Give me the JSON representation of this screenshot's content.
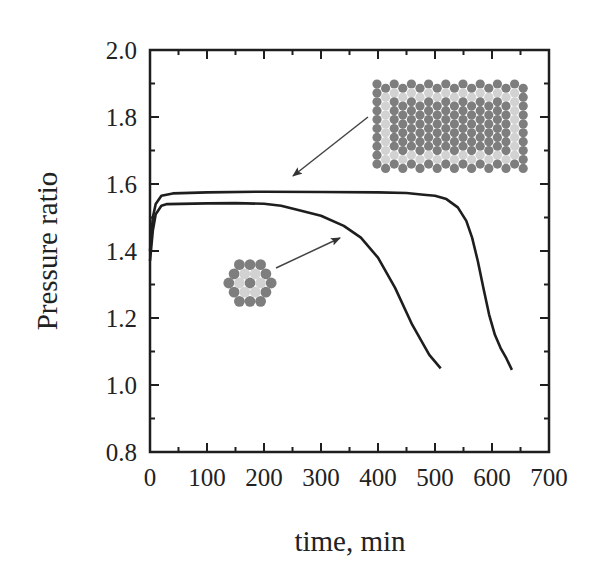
{
  "chart_data": {
    "type": "line",
    "title": "",
    "xlabel": "time, min",
    "ylabel": "Pressure ratio",
    "xlim": [
      0,
      700
    ],
    "ylim": [
      0.8,
      2.0
    ],
    "x_ticks": [
      0,
      100,
      200,
      300,
      400,
      500,
      600,
      700
    ],
    "x_tick_labels": [
      "0",
      "100",
      "200",
      "300",
      "400",
      "500",
      "600",
      "700"
    ],
    "y_ticks": [
      0.8,
      1.0,
      1.2,
      1.4,
      1.6,
      1.8,
      2.0
    ],
    "y_tick_labels": [
      "0.8",
      "1.0",
      "1.2",
      "1.4",
      "1.6",
      "1.8",
      "2.0"
    ],
    "grid": false,
    "legend": null,
    "series": [
      {
        "name": "large rectangular fiber bundle (inset, top right)",
        "x": [
          0,
          5,
          10,
          20,
          40,
          100,
          200,
          300,
          400,
          450,
          480,
          500,
          520,
          540,
          555,
          565,
          575,
          585,
          595,
          605,
          615,
          625,
          635
        ],
        "y": [
          1.4,
          1.5,
          1.54,
          1.565,
          1.572,
          1.575,
          1.577,
          1.576,
          1.575,
          1.573,
          1.568,
          1.565,
          1.555,
          1.53,
          1.49,
          1.44,
          1.37,
          1.29,
          1.21,
          1.15,
          1.11,
          1.08,
          1.045
        ]
      },
      {
        "name": "small hexagonal fiber bundle (inset, center)",
        "x": [
          0,
          5,
          10,
          20,
          30,
          100,
          150,
          200,
          230,
          260,
          300,
          340,
          370,
          400,
          430,
          460,
          490,
          510
        ],
        "y": [
          1.37,
          1.46,
          1.51,
          1.535,
          1.54,
          1.542,
          1.543,
          1.541,
          1.535,
          1.522,
          1.505,
          1.475,
          1.44,
          1.38,
          1.29,
          1.18,
          1.09,
          1.05
        ]
      }
    ],
    "annotations": [
      {
        "type": "inset-image",
        "description": "rectangular packing of circles (dark gray core, light gray ring, dark gray border)",
        "arrow_to": [
          245,
          1.58
        ]
      },
      {
        "type": "inset-image",
        "description": "hexagonal cluster of 19 circles (dark center, 6 light inner, 12 dark outer)",
        "arrow_to": [
          330,
          1.47
        ]
      }
    ]
  },
  "colors": {
    "line": "#1e1e1e",
    "axis": "#1e1e1e",
    "circle_dark": "#7e7e7e",
    "circle_light": "#d2d2d2"
  }
}
